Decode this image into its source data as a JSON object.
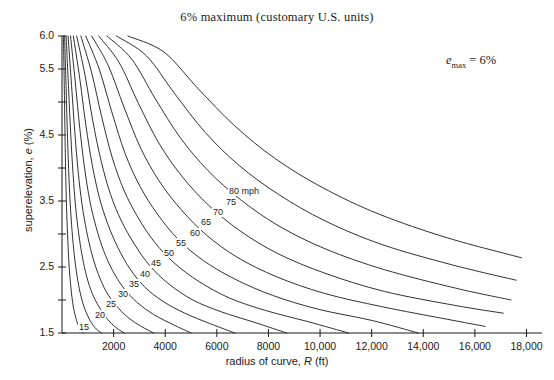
{
  "chart_data": {
    "type": "line",
    "title": "6% maximum (customary U.S. units)",
    "xlabel": "radius of curve, R (ft)",
    "ylabel": "superelevation, e (%)",
    "xlim": [
      0,
      18600
    ],
    "ylim": [
      1.5,
      6.0
    ],
    "grid": false,
    "legend": "inline-curve-labels",
    "annotation": "e_max = 6%",
    "annotation_parts": {
      "variable": "e",
      "subscript": "max",
      "equals": " = 6%"
    },
    "xticks": [
      2000,
      4000,
      6000,
      8000,
      10000,
      12000,
      14000,
      16000,
      18000
    ],
    "xtick_labels": [
      "2000",
      "4000",
      "6000",
      "8000",
      "10,000",
      "12,000",
      "14,000",
      "16,000",
      "18,000"
    ],
    "yticks": [
      1.5,
      2.0,
      2.5,
      3.0,
      3.5,
      4.0,
      4.5,
      5.0,
      5.5,
      6.0
    ],
    "ytick_labels": [
      "1.5",
      "",
      "2.5",
      "",
      "3.5",
      "",
      "4.5",
      "",
      "5.5",
      "6.0"
    ],
    "series_units": "mph",
    "series": [
      {
        "name": "15",
        "label": "15",
        "label_x": 78,
        "label_y": 322,
        "points": [
          [
            55,
            6.0
          ],
          [
            90,
            5.2
          ],
          [
            120,
            4.4
          ],
          [
            150,
            3.8
          ],
          [
            185,
            3.3
          ],
          [
            225,
            2.9
          ],
          [
            270,
            2.55
          ],
          [
            330,
            2.25
          ],
          [
            400,
            2.0
          ],
          [
            490,
            1.8
          ],
          [
            600,
            1.65
          ],
          [
            720,
            1.55
          ],
          [
            830,
            1.5
          ]
        ]
      },
      {
        "name": "20",
        "label": "20",
        "label_x": 94,
        "label_y": 310,
        "points": [
          [
            100,
            6.0
          ],
          [
            160,
            5.2
          ],
          [
            215,
            4.45
          ],
          [
            270,
            3.85
          ],
          [
            335,
            3.35
          ],
          [
            410,
            2.95
          ],
          [
            500,
            2.6
          ],
          [
            610,
            2.3
          ],
          [
            740,
            2.05
          ],
          [
            900,
            1.85
          ],
          [
            1100,
            1.68
          ],
          [
            1330,
            1.56
          ],
          [
            1540,
            1.5
          ]
        ]
      },
      {
        "name": "25",
        "label": "25",
        "label_x": 105,
        "label_y": 299,
        "points": [
          [
            160,
            6.0
          ],
          [
            255,
            5.2
          ],
          [
            340,
            4.5
          ],
          [
            430,
            3.9
          ],
          [
            530,
            3.4
          ],
          [
            650,
            3.0
          ],
          [
            790,
            2.65
          ],
          [
            960,
            2.35
          ],
          [
            1170,
            2.1
          ],
          [
            1430,
            1.9
          ],
          [
            1740,
            1.72
          ],
          [
            2100,
            1.58
          ],
          [
            2420,
            1.5
          ]
        ]
      },
      {
        "name": "30",
        "label": "30",
        "label_x": 117,
        "label_y": 289,
        "points": [
          [
            235,
            6.0
          ],
          [
            370,
            5.25
          ],
          [
            495,
            4.55
          ],
          [
            625,
            3.95
          ],
          [
            775,
            3.45
          ],
          [
            950,
            3.05
          ],
          [
            1155,
            2.7
          ],
          [
            1400,
            2.4
          ],
          [
            1710,
            2.13
          ],
          [
            2090,
            1.92
          ],
          [
            2540,
            1.74
          ],
          [
            3070,
            1.6
          ],
          [
            3550,
            1.5
          ]
        ]
      },
      {
        "name": "35",
        "label": "35",
        "label_x": 128,
        "label_y": 279,
        "points": [
          [
            330,
            6.0
          ],
          [
            515,
            5.3
          ],
          [
            690,
            4.6
          ],
          [
            875,
            4.0
          ],
          [
            1080,
            3.5
          ],
          [
            1325,
            3.1
          ],
          [
            1610,
            2.75
          ],
          [
            1955,
            2.45
          ],
          [
            2390,
            2.18
          ],
          [
            2920,
            1.96
          ],
          [
            3550,
            1.78
          ],
          [
            4290,
            1.63
          ],
          [
            5000,
            1.5
          ]
        ]
      },
      {
        "name": "40",
        "label": "40",
        "label_x": 139,
        "label_y": 269,
        "points": [
          [
            440,
            6.0
          ],
          [
            690,
            5.35
          ],
          [
            925,
            4.65
          ],
          [
            1170,
            4.05
          ],
          [
            1450,
            3.55
          ],
          [
            1775,
            3.15
          ],
          [
            2160,
            2.8
          ],
          [
            2620,
            2.48
          ],
          [
            3200,
            2.2
          ],
          [
            3910,
            1.98
          ],
          [
            4760,
            1.8
          ],
          [
            5750,
            1.64
          ],
          [
            6700,
            1.5
          ]
        ]
      },
      {
        "name": "45",
        "label": "45",
        "label_x": 150,
        "label_y": 258,
        "points": [
          [
            570,
            6.0
          ],
          [
            895,
            5.4
          ],
          [
            1200,
            4.7
          ],
          [
            1520,
            4.1
          ],
          [
            1880,
            3.6
          ],
          [
            2300,
            3.2
          ],
          [
            2800,
            2.85
          ],
          [
            3400,
            2.52
          ],
          [
            4150,
            2.24
          ],
          [
            5070,
            2.0
          ],
          [
            6180,
            1.82
          ],
          [
            7470,
            1.66
          ],
          [
            8700,
            1.5
          ]
        ]
      },
      {
        "name": "50",
        "label": "50",
        "label_x": 163,
        "label_y": 248,
        "points": [
          [
            730,
            6.0
          ],
          [
            1145,
            5.45
          ],
          [
            1535,
            4.78
          ],
          [
            1945,
            4.16
          ],
          [
            2405,
            3.66
          ],
          [
            2945,
            3.25
          ],
          [
            3580,
            2.88
          ],
          [
            4350,
            2.56
          ],
          [
            5310,
            2.28
          ],
          [
            6490,
            2.03
          ],
          [
            7900,
            1.84
          ],
          [
            9550,
            1.67
          ],
          [
            11100,
            1.5
          ]
        ]
      },
      {
        "name": "55",
        "label": "55",
        "label_x": 175,
        "label_y": 238,
        "points": [
          [
            920,
            6.0
          ],
          [
            1440,
            5.5
          ],
          [
            1930,
            4.85
          ],
          [
            2445,
            4.22
          ],
          [
            3025,
            3.72
          ],
          [
            3700,
            3.3
          ],
          [
            4500,
            2.92
          ],
          [
            5470,
            2.6
          ],
          [
            6680,
            2.32
          ],
          [
            8160,
            2.07
          ],
          [
            9930,
            1.86
          ],
          [
            12010,
            1.69
          ],
          [
            13800,
            1.5
          ]
        ]
      },
      {
        "name": "60",
        "label": "60",
        "label_x": 189,
        "label_y": 228,
        "points": [
          [
            1150,
            6.0
          ],
          [
            1795,
            5.55
          ],
          [
            2405,
            4.92
          ],
          [
            3050,
            4.3
          ],
          [
            3770,
            3.8
          ],
          [
            4615,
            3.37
          ],
          [
            5610,
            2.98
          ],
          [
            6820,
            2.64
          ],
          [
            8330,
            2.35
          ],
          [
            10170,
            2.1
          ],
          [
            12380,
            1.9
          ],
          [
            14900,
            1.71
          ],
          [
            16400,
            1.6
          ]
        ]
      },
      {
        "name": "65",
        "label": "65",
        "label_x": 200,
        "label_y": 217,
        "points": [
          [
            1420,
            6.0
          ],
          [
            2210,
            5.6
          ],
          [
            2960,
            4.98
          ],
          [
            3750,
            4.38
          ],
          [
            4635,
            3.88
          ],
          [
            5670,
            3.44
          ],
          [
            6890,
            3.05
          ],
          [
            8380,
            2.7
          ],
          [
            10230,
            2.4
          ],
          [
            12490,
            2.13
          ],
          [
            15200,
            1.92
          ],
          [
            17100,
            1.8
          ]
        ]
      },
      {
        "name": "70",
        "label": "70",
        "label_x": 212,
        "label_y": 207,
        "points": [
          [
            1740,
            6.0
          ],
          [
            2700,
            5.65
          ],
          [
            3615,
            5.05
          ],
          [
            4580,
            4.46
          ],
          [
            5660,
            3.96
          ],
          [
            6920,
            3.52
          ],
          [
            8410,
            3.12
          ],
          [
            10230,
            2.77
          ],
          [
            12490,
            2.46
          ],
          [
            15250,
            2.18
          ],
          [
            17400,
            2.0
          ]
        ]
      },
      {
        "name": "75",
        "label": "75",
        "label_x": 225,
        "label_y": 197,
        "points": [
          [
            2110,
            6.0
          ],
          [
            3270,
            5.7
          ],
          [
            4380,
            5.12
          ],
          [
            5550,
            4.54
          ],
          [
            6860,
            4.04
          ],
          [
            8390,
            3.6
          ],
          [
            10190,
            3.2
          ],
          [
            12400,
            2.84
          ],
          [
            15140,
            2.53
          ],
          [
            17600,
            2.3
          ]
        ]
      },
      {
        "name": "80",
        "label": "80 mph",
        "label_x": 228,
        "label_y": 186,
        "points": [
          [
            2550,
            6.0
          ],
          [
            3940,
            5.76
          ],
          [
            5280,
            5.2
          ],
          [
            6690,
            4.64
          ],
          [
            8270,
            4.14
          ],
          [
            10110,
            3.7
          ],
          [
            12290,
            3.3
          ],
          [
            14950,
            2.94
          ],
          [
            17800,
            2.64
          ]
        ]
      }
    ]
  }
}
